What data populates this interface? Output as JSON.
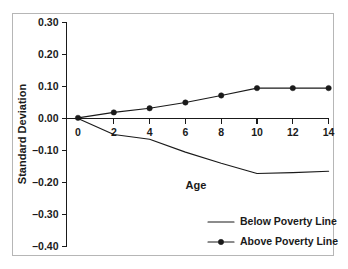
{
  "chart_data": {
    "type": "line",
    "title": "",
    "xlabel": "Age",
    "ylabel": "Standard Deviation",
    "xlim": [
      -0.9,
      15.2
    ],
    "ylim": [
      -0.4,
      0.3
    ],
    "grid": false,
    "legend_position": "bottom-right",
    "x_ticks": [
      0,
      2,
      4,
      6,
      8,
      10,
      12,
      14
    ],
    "x_tick_labels": [
      "0",
      "2",
      "4",
      "6",
      "8",
      "10",
      "12",
      "14"
    ],
    "y_ticks": [
      0.3,
      0.2,
      0.1,
      0.0,
      -0.1,
      -0.2,
      -0.3,
      -0.4
    ],
    "y_tick_labels": [
      "0.30",
      "0.20",
      "0.10",
      "0.00",
      "–0.10",
      "–0.20",
      "–0.30",
      "–0.40"
    ],
    "x": [
      0,
      2,
      4,
      6,
      8,
      10,
      12,
      14
    ],
    "series": [
      {
        "name": "Below Poverty Line",
        "marker": "none",
        "values": [
          0.0,
          -0.05,
          -0.065,
          -0.105,
          -0.14,
          -0.172,
          -0.169,
          -0.165
        ]
      },
      {
        "name": "Above Poverty Line",
        "marker": "circle",
        "values": [
          0.002,
          0.019,
          0.032,
          0.05,
          0.072,
          0.095,
          0.095,
          0.095
        ]
      }
    ],
    "legend": [
      {
        "label": "Below Poverty Line",
        "marker": "none"
      },
      {
        "label": "Above Poverty Line",
        "marker": "circle"
      }
    ],
    "colors": {
      "line": "#1a1a1a",
      "axis": "#1a1a1a",
      "background": "#ffffff",
      "frame_border": "#b6b6b6"
    }
  }
}
